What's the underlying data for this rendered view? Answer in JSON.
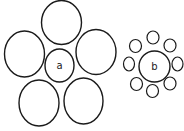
{
  "stroke_color": "#1a1a1a",
  "clusters": [
    {
      "label": "a",
      "center": {
        "cx": 59.5,
        "cy": 65.5,
        "rx": 14.5,
        "ry": 16.5
      },
      "outer": [
        {
          "cx": 61.5,
          "cy": 22.5,
          "rx": 20,
          "ry": 22
        },
        {
          "cx": 24.5,
          "cy": 54,
          "rx": 20,
          "ry": 23
        },
        {
          "cx": 96,
          "cy": 52,
          "rx": 20,
          "ry": 22.5
        },
        {
          "cx": 39,
          "cy": 103,
          "rx": 20,
          "ry": 23
        },
        {
          "cx": 83.5,
          "cy": 101,
          "rx": 19.5,
          "ry": 23
        }
      ]
    },
    {
      "label": "b",
      "center": {
        "cx": 154.5,
        "cy": 66.5,
        "rx": 15.5,
        "ry": 15.5
      },
      "outer": [
        {
          "cx": 153,
          "cy": 37.5,
          "rx": 6,
          "ry": 6.5
        },
        {
          "cx": 170,
          "cy": 45.5,
          "rx": 6,
          "ry": 6.5
        },
        {
          "cx": 177.5,
          "cy": 64,
          "rx": 5.5,
          "ry": 7
        },
        {
          "cx": 170,
          "cy": 83.5,
          "rx": 6,
          "ry": 6.5
        },
        {
          "cx": 152.5,
          "cy": 91,
          "rx": 6,
          "ry": 6.5
        },
        {
          "cx": 136.5,
          "cy": 84,
          "rx": 6,
          "ry": 6.5
        },
        {
          "cx": 129,
          "cy": 64,
          "rx": 5.5,
          "ry": 7
        },
        {
          "cx": 135.5,
          "cy": 46,
          "rx": 6,
          "ry": 6.5
        }
      ]
    }
  ]
}
